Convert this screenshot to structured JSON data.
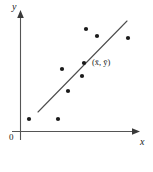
{
  "chart_data": {
    "type": "scatter",
    "title": "",
    "subtitle": "",
    "xlabel": "x",
    "ylabel": "y",
    "origin_label": "0",
    "grid": false,
    "legend": null,
    "xlim": [
      0,
      10
    ],
    "ylim": [
      0,
      10
    ],
    "axis_color": "#4d4d4d",
    "point_color": "#1a1a1a",
    "line_color": "#4d4d4d",
    "points": [
      {
        "px": 29,
        "py": 119,
        "x": 0.8,
        "y": 1.0
      },
      {
        "px": 58,
        "py": 119,
        "x": 3.2,
        "y": 1.0
      },
      {
        "px": 68,
        "py": 91,
        "x": 4.0,
        "y": 3.4
      },
      {
        "px": 62,
        "py": 69,
        "x": 3.5,
        "y": 5.2
      },
      {
        "px": 82,
        "py": 76,
        "x": 5.2,
        "y": 4.6
      },
      {
        "px": 84,
        "py": 63,
        "x": 5.3,
        "y": 5.7
      },
      {
        "px": 86,
        "py": 29,
        "x": 5.5,
        "y": 8.6
      },
      {
        "px": 97,
        "py": 36,
        "x": 6.4,
        "y": 8.0
      },
      {
        "px": 128,
        "py": 38,
        "x": 9.0,
        "y": 7.8
      }
    ],
    "regression_line": {
      "x1_px": 38,
      "y1_px": 112,
      "x2_px": 127,
      "y2_px": 21,
      "x1": 1.6,
      "y1": 1.6,
      "x2": 9.0,
      "y2": 9.2
    },
    "annotations": [
      {
        "text": "(x̄, ȳ)",
        "meaning": "mean-point",
        "px": 92,
        "py": 58
      }
    ]
  },
  "axes": {
    "y_label": "y",
    "x_label": "x",
    "origin": "0"
  },
  "annotation": {
    "mean_point": "(x̄, ȳ)"
  }
}
